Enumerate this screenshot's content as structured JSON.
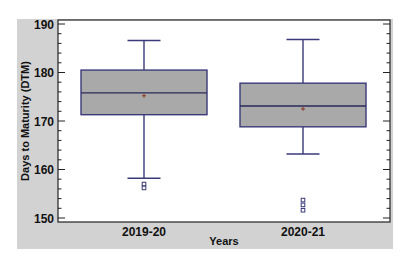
{
  "chart_data": {
    "type": "box",
    "title": "",
    "xlabel": "Years",
    "ylabel": "Days to Maturity (DTM)",
    "ylim": [
      149,
      190
    ],
    "yticks": [
      150,
      160,
      170,
      180,
      190
    ],
    "categories": [
      "2019-20",
      "2020-21"
    ],
    "series": [
      {
        "name": "2019-20",
        "whisker_high": 186.6,
        "q3": 180.5,
        "median": 175.8,
        "mean": 175.2,
        "q1": 171.3,
        "whisker_low": 158.2,
        "outliers": [
          157.0,
          156.2
        ]
      },
      {
        "name": "2020-21",
        "whisker_high": 186.8,
        "q3": 177.8,
        "median": 173.1,
        "mean": 172.5,
        "q1": 168.8,
        "whisker_low": 163.2,
        "outliers": [
          153.7,
          152.7,
          151.6
        ]
      }
    ],
    "grid": false,
    "legend": "none"
  },
  "colors": {
    "panel_bg": "#d2d2d2",
    "plot_bg": "#ffffff",
    "box_fill": "#a9a9a9",
    "box_stroke": "#3a3a7a",
    "mean_marker": "#8a3a20",
    "axis": "#222222"
  }
}
